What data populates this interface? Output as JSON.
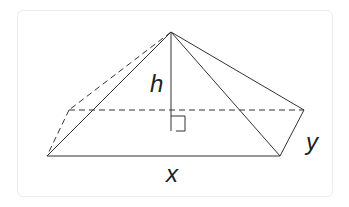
{
  "diagram": {
    "type": "rectangular pyramid",
    "labels": {
      "height": "h",
      "base_length": "x",
      "base_width": "y"
    },
    "colors": {
      "line": "#333333",
      "frame": "#ececec"
    }
  }
}
